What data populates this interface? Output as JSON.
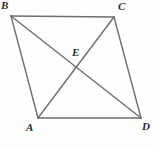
{
  "figure": {
    "name": "Parallelogram ABCD with intersecting diagonals",
    "background_color": "#fefefe",
    "stroke_color": "#6e6e6e",
    "label_color": "#2b2b2b",
    "stroke_width": 1.4,
    "canvas": {
      "width": 159,
      "height": 146
    }
  },
  "points": {
    "A": {
      "label": "A",
      "x": 38,
      "y": 118
    },
    "B": {
      "label": "B",
      "x": 11,
      "y": 16
    },
    "C": {
      "label": "C",
      "x": 114,
      "y": 17
    },
    "D": {
      "label": "D",
      "x": 141,
      "y": 118
    },
    "E": {
      "label": "E",
      "x": 76,
      "y": 66
    }
  },
  "segments": [
    {
      "name": "side-BC",
      "from": "B",
      "to": "C"
    },
    {
      "name": "side-CD",
      "from": "C",
      "to": "D"
    },
    {
      "name": "side-DA",
      "from": "D",
      "to": "A"
    },
    {
      "name": "side-AB",
      "from": "A",
      "to": "B"
    },
    {
      "name": "diagonal-BD",
      "from": "B",
      "to": "D"
    },
    {
      "name": "diagonal-AC",
      "from": "A",
      "to": "C"
    }
  ],
  "labels": {
    "A": "A",
    "B": "B",
    "C": "C",
    "D": "D",
    "E": "E"
  }
}
